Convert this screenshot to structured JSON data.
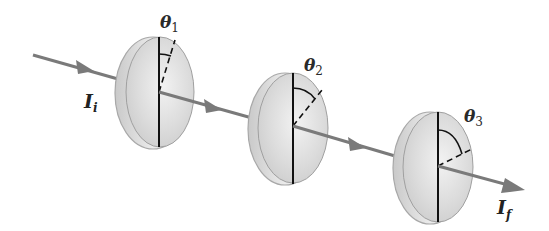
{
  "diagram": {
    "type": "polarizer-sequence",
    "beam": {
      "color": "#7a7a7a",
      "input_label": {
        "symbol": "I",
        "subscript": "i"
      },
      "output_label": {
        "symbol": "I",
        "subscript": "f"
      }
    },
    "polarizers": [
      {
        "id": 1,
        "angle_label": {
          "symbol": "θ",
          "subscript": "1"
        },
        "angle_deg": 15
      },
      {
        "id": 2,
        "angle_label": {
          "symbol": "θ",
          "subscript": "2"
        },
        "angle_deg": 40
      },
      {
        "id": 3,
        "angle_label": {
          "symbol": "θ",
          "subscript": "3"
        },
        "angle_deg": 68
      }
    ],
    "colors": {
      "disc_face": "#d6d6d6",
      "disc_edge": "#bdbdbd",
      "disc_outline": "#9a9a9a",
      "axis_line": "#111111"
    }
  }
}
